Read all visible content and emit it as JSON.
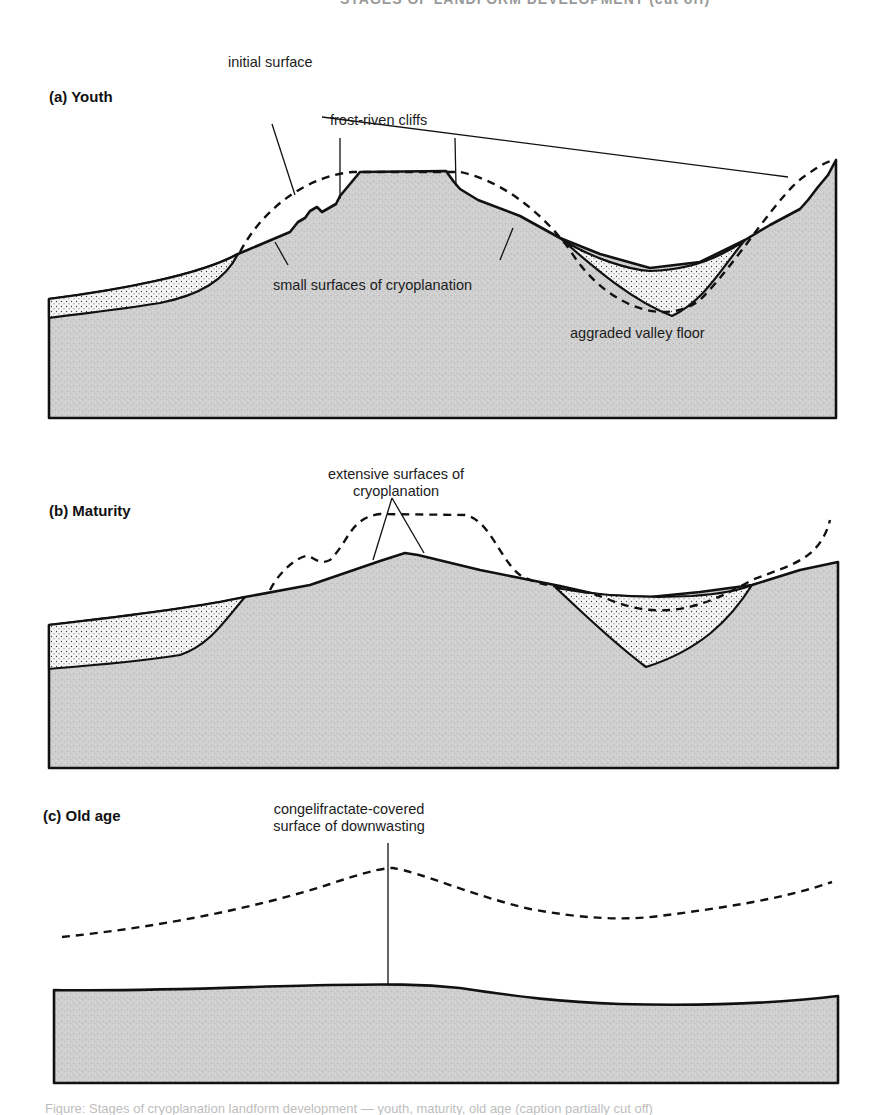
{
  "header": {
    "text": "STAGES OF LANDFORM DEVELOPMENT (cut off)",
    "visible_fragment": "cropped header text at top edge"
  },
  "colors": {
    "bedrock_fill": "#cfcfcf",
    "bedrock_grain": "#b5b5b5",
    "sediment_fill": "#f6f6f6",
    "sediment_dot": "#3a3a3a",
    "outline": "#111111",
    "background": "#ffffff"
  },
  "panels": [
    {
      "id": "a",
      "title": "(a) Youth",
      "labels": {
        "initial_surface": "initial surface",
        "frost_riven_cliffs": "frost-riven cliffs",
        "small_surfaces": "small surfaces of cryoplanation",
        "aggraded_valley": "aggraded valley floor"
      },
      "paths": {
        "bedrock": "M49,299 C120,290 200,275 238,254 L290,232 L298,222 L305,218 L310,211 L317,207 L322,212 L336,204 L340,196 L360,172 L446,171 L454,182 L460,189 L478,200 L520,216 L560,238 L600,254 L650,268 L700,262 L745,240 L770,225 L800,209 L808,200 L818,187 L828,175 L836,160 L836,418 L49,418 Z",
        "sediment_left": "M49,299 C120,290 200,275 238,254 C225,280 200,295 160,303 C110,311 70,315 49,318 Z",
        "sediment_valley": "M560,238 C590,258 630,270 650,271 C690,270 720,258 745,240 C720,270 705,300 672,316 C630,300 590,264 560,238 Z",
        "initial_surface": "M240,252 C265,205 310,176 352,172 L460,172 C500,180 540,210 570,250 C600,300 660,330 700,300 C740,260 780,190 808,174 C820,165 830,160 836,160"
      },
      "leaders": [
        {
          "name": "initial-surface-leader-left",
          "d": "M272,124 L295,195"
        },
        {
          "name": "initial-surface-leader-right",
          "d": "M322,117 L788,177"
        },
        {
          "name": "frost-riven-cliffs-leader-left",
          "d": "M340,138 L340,199"
        },
        {
          "name": "frost-riven-cliffs-leader-right",
          "d": "M455,138 L456,186"
        },
        {
          "name": "small-surfaces-leader-left",
          "d": "M288,265 L275,242"
        },
        {
          "name": "small-surfaces-leader-right",
          "d": "M500,260 L513,228"
        }
      ]
    },
    {
      "id": "b",
      "title": "(b) Maturity",
      "labels": {
        "extensive_surfaces_line1": "extensive surfaces of",
        "extensive_surfaces_line2": "cryoplanation"
      },
      "paths": {
        "bedrock": "M49,625 C120,617 200,607 245,597 L310,585 L380,561 L405,553 L418,555 L480,570 L520,578 L560,586 L600,595 L650,597 L700,592 L752,585 L800,570 L838,562 L838,768 L49,768 Z",
        "sediment_left": "M49,625 C120,617 200,607 245,597 C225,620 210,645 180,655 C130,663 80,666 49,669 Z",
        "sediment_valley": "M556,588 C600,596 650,598 692,596 C720,594 740,590 752,585 C730,620 700,650 646,667 C610,640 580,610 556,588 Z",
        "initial_surface": "M270,590 C280,570 300,555 308,556 C316,559 320,565 330,560 C350,540 350,518 380,514 L465,515 C490,520 500,560 520,575 C545,590 575,585 610,600 C660,620 700,610 752,580 C790,565 820,560 830,520"
      },
      "leaders": [
        {
          "name": "extensive-surfaces-leader-left",
          "d": "M392,498 L373,560"
        },
        {
          "name": "extensive-surfaces-leader-right",
          "d": "M392,498 L424,553"
        }
      ]
    },
    {
      "id": "c",
      "title": "(c) Old age",
      "labels": {
        "congelifractate_line1": "congelifractate-covered",
        "congelifractate_line2": "surface of downwasting"
      },
      "paths": {
        "bedrock": "M54,990 C150,992 260,986 330,985 C390,984 420,984 460,988 C520,997 560,1002 620,1004 C700,1006 780,1003 838,996 L838,1083 L54,1083 Z",
        "initial_surface": "M62,937 C150,928 250,910 330,884 C360,874 380,868 393,868 C420,872 470,895 530,909 C580,918 620,921 660,916 C720,908 780,900 832,882"
      },
      "leaders": [
        {
          "name": "congelifractate-leader",
          "d": "M388,843 L388,985"
        }
      ]
    }
  ],
  "caption": {
    "text": "Figure: Stages of cryoplanation landform development — youth, maturity, old age (caption partially cut off)"
  }
}
